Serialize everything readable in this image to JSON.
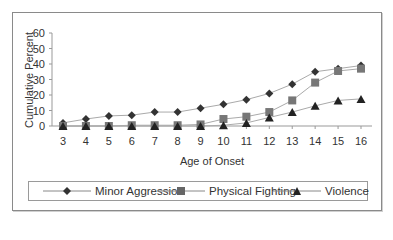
{
  "chart_data": {
    "type": "line",
    "title": "",
    "xlabel": "Age of Onset",
    "ylabel": "Cumulative Percent",
    "x": [
      3,
      4,
      5,
      6,
      7,
      8,
      9,
      10,
      11,
      12,
      13,
      14,
      15,
      16
    ],
    "ylim": [
      0,
      60
    ],
    "yticks": [
      0,
      10,
      20,
      30,
      40,
      50,
      60
    ],
    "grid": false,
    "legend_position": "bottom",
    "series": [
      {
        "name": "Minor Aggression",
        "marker": "diamond",
        "color": "#333333",
        "values": [
          2,
          4.5,
          6.5,
          7,
          9,
          9,
          11.5,
          14,
          17,
          21,
          27,
          35,
          37,
          39
        ]
      },
      {
        "name": "Physical Fighting",
        "marker": "square",
        "color": "#777777",
        "values": [
          0,
          0,
          0,
          0.5,
          0.5,
          0.5,
          1,
          4.5,
          6,
          9,
          16.5,
          28,
          35.5,
          37
        ]
      },
      {
        "name": "Violence",
        "marker": "triangle",
        "color": "#222222",
        "values": [
          0,
          0,
          0,
          0,
          0,
          0,
          0,
          0.5,
          2,
          5.5,
          9,
          13,
          16.5,
          17.5
        ]
      }
    ]
  },
  "colors": {
    "line": "#aaaaaa",
    "axis": "#999999",
    "frame": "#8a8a8a"
  }
}
